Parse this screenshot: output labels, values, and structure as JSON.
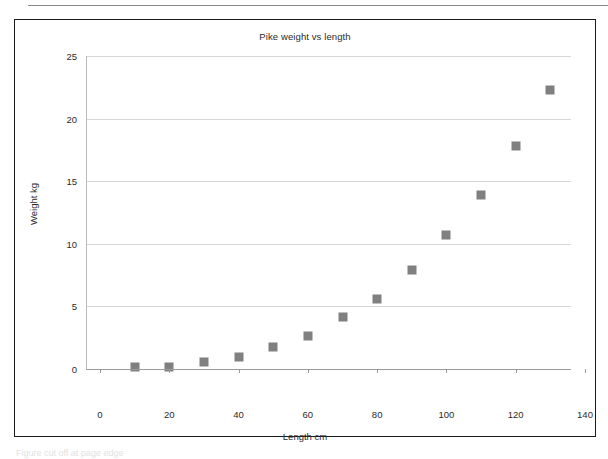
{
  "page": {
    "background_color": "#ffffff",
    "frame_color": "#1a1a1a",
    "top_rule": "horizontal-rule",
    "caption_clipped": "Figure cut off at page edge"
  },
  "chart_data": {
    "type": "scatter",
    "title": "Pike weight vs length",
    "xlabel": "Length cm",
    "ylabel": "Weight kg",
    "xlim": [
      0,
      140
    ],
    "ylim": [
      0,
      25
    ],
    "xticks": [
      0,
      20,
      40,
      60,
      80,
      100,
      120,
      140
    ],
    "yticks": [
      0,
      5,
      10,
      15,
      20,
      25
    ],
    "xtick_labels": [
      "0",
      "20",
      "40",
      "60",
      "80",
      "100",
      "120",
      "140"
    ],
    "ytick_labels": [
      "0",
      "5",
      "10",
      "15",
      "20",
      "25"
    ],
    "grid": "horizontal",
    "grid_color": "#d6d6d6",
    "legend": "none",
    "marker_shape": "square",
    "marker_color": "#808080",
    "series": [
      {
        "name": "Pike",
        "x": [
          10,
          20,
          30,
          40,
          50,
          60,
          70,
          80,
          90,
          100,
          110,
          120,
          130
        ],
        "y": [
          0.1,
          0.15,
          0.55,
          0.95,
          1.75,
          2.6,
          4.1,
          5.6,
          7.85,
          10.7,
          13.9,
          17.8,
          22.3
        ]
      }
    ]
  }
}
